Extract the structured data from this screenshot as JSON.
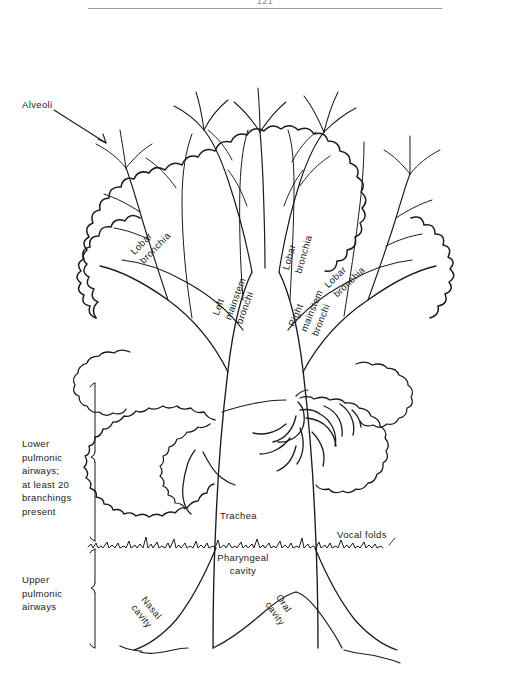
{
  "document": {
    "page_number": "121",
    "figure_title": "Schematic tree representation of the pulmonic airways"
  },
  "labels": {
    "alveoli": "Alveoli",
    "lobar_bronchia_left": "Lobar\nbronchia",
    "lobar_bronchia_mid": "Lobar\nbronchia",
    "lobar_bronchia_right": "Lobar\nbronchia",
    "left_mainstem": "Left\nmainstem\nbronchi",
    "right_mainstem": "Right\nmainstem\nbronchi",
    "trachea": "Trachea",
    "vocal_folds": "Vocal folds",
    "pharyngeal_cavity": "Pharyngeal\ncavity",
    "nasal_cavity": "Nasal\ncavity",
    "oral_cavity": "Oral\ncavity",
    "lower_airways": "Lower\npulmonic\nairways;\nat least 20\nbranchings\npresent",
    "upper_airways": "Upper\npulmonic\nairways"
  },
  "colors": {
    "ink": "#1b1b1b",
    "rule": "#9b9b9b",
    "page_background": "#ffffff"
  },
  "structure": {
    "regions": [
      {
        "name": "Lower pulmonic airways",
        "extent_top": 383,
        "extent_bottom": 541
      },
      {
        "name": "Upper pulmonic airways",
        "extent_top": 549,
        "extent_bottom": 648
      }
    ],
    "divider": "vocal folds jagged line"
  }
}
